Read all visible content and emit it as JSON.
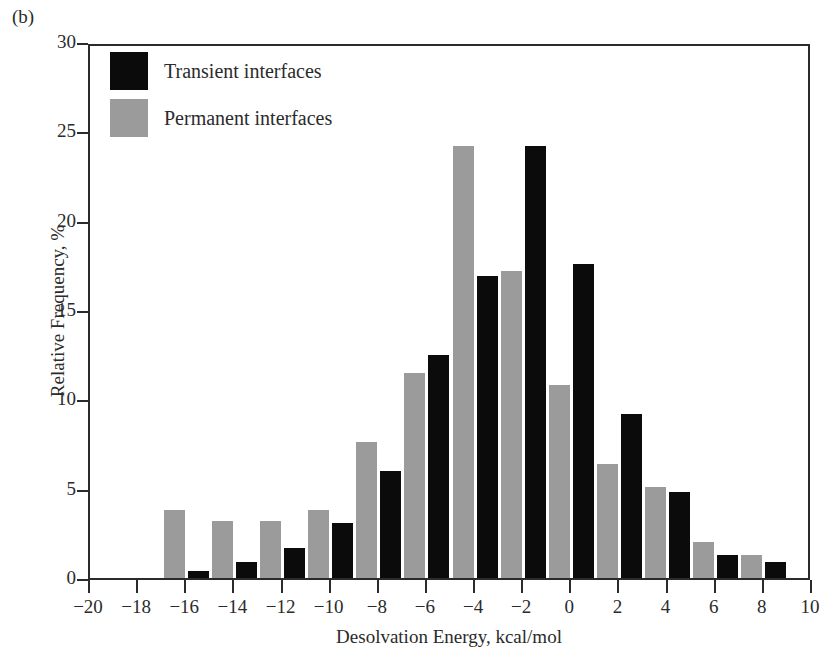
{
  "panel": {
    "label": "(b)"
  },
  "legend": {
    "items": [
      {
        "name": "transient",
        "label": "Transient interfaces",
        "color": "#0b0b0b"
      },
      {
        "name": "permanent",
        "label": "Permanent interfaces",
        "color": "#9b9b9b"
      }
    ]
  },
  "chart_data": {
    "type": "bar",
    "title": "",
    "xlabel": "Desolvation Energy, kcal/mol",
    "ylabel": "Relative Frequency, %",
    "xlim": [
      -20,
      10
    ],
    "ylim": [
      0,
      30
    ],
    "xticks": [
      -20,
      -18,
      -16,
      -14,
      -12,
      -10,
      -8,
      -6,
      -4,
      -2,
      0,
      2,
      4,
      6,
      8,
      10
    ],
    "yticks": [
      0,
      5,
      10,
      15,
      20,
      25,
      30
    ],
    "grid": false,
    "legend_position": "top-left",
    "bin_width": 2,
    "bin_starts": [
      -20,
      -18,
      -16,
      -14,
      -12,
      -10,
      -8,
      -6,
      -4,
      -2,
      0,
      2,
      4,
      6,
      8
    ],
    "categories": [
      "-20 to -18",
      "-18 to -16",
      "-16 to -14",
      "-14 to -12",
      "-12 to -10",
      "-10 to -8",
      "-8 to -6",
      "-6 to -4",
      "-4 to -2",
      "-2 to 0",
      "0 to 2",
      "2 to 4",
      "4 to 6",
      "6 to 8",
      "8 to 10"
    ],
    "series": [
      {
        "name": "Transient interfaces",
        "color": "#0b0b0b",
        "values": [
          0.0,
          0.0,
          0.4,
          0.9,
          1.7,
          3.1,
          6.0,
          12.5,
          16.9,
          24.2,
          17.6,
          9.2,
          4.8,
          1.3,
          0.9
        ]
      },
      {
        "name": "Permanent interfaces",
        "color": "#9b9b9b",
        "values": [
          0.0,
          3.8,
          3.2,
          3.2,
          3.8,
          7.6,
          11.5,
          24.2,
          17.2,
          10.8,
          6.4,
          5.1,
          2.0,
          1.3,
          0.0
        ]
      }
    ]
  }
}
